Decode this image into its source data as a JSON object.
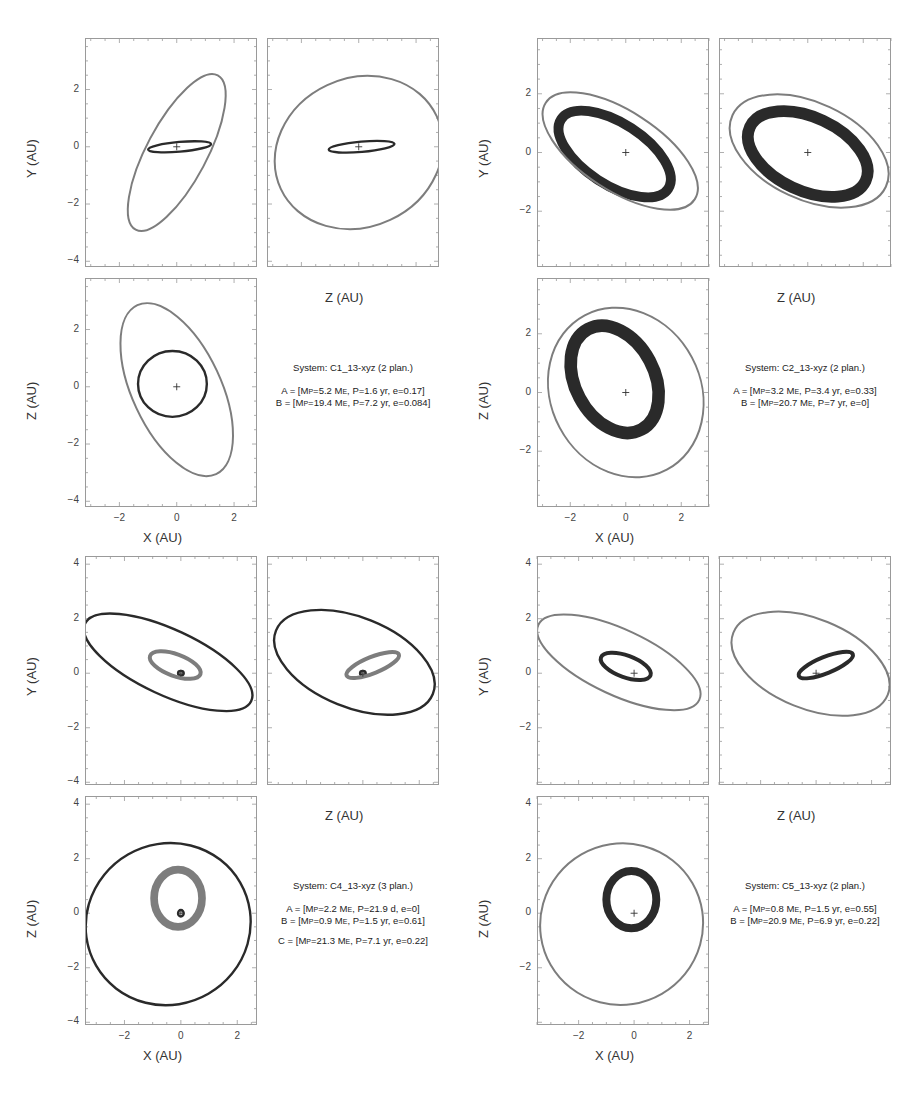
{
  "page": {
    "page_number": "9"
  },
  "axis_labels": {
    "x": "X (AU)",
    "y": "Y (AU)",
    "z": "Z (AU)"
  },
  "colors": {
    "dark_orbit": "#2a2a2a",
    "gray_orbit": "#7d7d7d",
    "frame": "#9a9a9a"
  },
  "chart_data": [
    {
      "type": "scatter",
      "title": "System: C1_13-xyz (2 plan.)",
      "panels": [
        "X-Y",
        "Z-Y",
        "X-Z"
      ],
      "xlabel": "X (AU)",
      "ylabel": "Y (AU)",
      "zlabel": "Z (AU)",
      "xlim": [
        -3.2,
        2.8
      ],
      "ylim": [
        -4.2,
        3.8
      ],
      "yticks": [
        -4,
        -2,
        0,
        2
      ],
      "xticks": [
        -2,
        0,
        2
      ],
      "grid": false,
      "planets": [
        {
          "name": "A",
          "Mp": "5.2 ME",
          "P": "1.6 yr",
          "e": "0.17",
          "color": "dark",
          "xy": {
            "cx": 0.1,
            "cy": 0.0,
            "rx": 1.1,
            "ry": 0.17,
            "rot": -5
          },
          "zy": {
            "cx": 0.1,
            "cy": 0.0,
            "rx": 1.15,
            "ry": 0.18,
            "rot": -5
          },
          "xz": {
            "cx": -0.15,
            "cy": 0.1,
            "rx": 1.2,
            "ry": 1.15,
            "rot": 0
          }
        },
        {
          "name": "B",
          "Mp": "19.4 ME",
          "P": "7.2 yr",
          "e": "0.084",
          "color": "gray",
          "xy": {
            "cx": 0.0,
            "cy": -0.2,
            "rx": 3.05,
            "ry": 1.05,
            "rot": -62
          },
          "zy": {
            "cx": 0.0,
            "cy": -0.2,
            "rx": 3.0,
            "ry": 2.6,
            "rot": -25
          },
          "xz": {
            "cx": 0.0,
            "cy": -0.1,
            "rx": 3.25,
            "ry": 1.55,
            "rot": 65
          }
        }
      ]
    },
    {
      "type": "scatter",
      "title": "System: C2_13-xyz (2 plan.)",
      "panels": [
        "X-Y",
        "Z-Y",
        "X-Z"
      ],
      "xlabel": "X (AU)",
      "ylabel": "Y (AU)",
      "zlabel": "Z (AU)",
      "xlim": [
        -3.2,
        3.0
      ],
      "ylim": [
        -3.9,
        3.9
      ],
      "yticks": [
        -2,
        0,
        2
      ],
      "xticks": [
        -2,
        0,
        2
      ],
      "grid": false,
      "planets": [
        {
          "name": "A",
          "Mp": "3.2 ME",
          "P": "3.4 yr",
          "e": "0.33",
          "color": "dark",
          "band": true,
          "xy": {
            "cx": -0.4,
            "cy": -0.05,
            "rx": 2.3,
            "ry": 1.05,
            "rot": 33
          },
          "zy": {
            "cx": 0.0,
            "cy": -0.05,
            "rx": 2.3,
            "ry": 1.25,
            "rot": 25
          },
          "xz": {
            "cx": -0.4,
            "cy": 0.45,
            "rx": 2.05,
            "ry": 1.35,
            "rot": 62
          }
        },
        {
          "name": "B",
          "Mp": "20.7 ME",
          "P": "7 yr",
          "e": "0",
          "color": "gray",
          "xy": {
            "cx": -0.2,
            "cy": 0.05,
            "rx": 3.2,
            "ry": 1.35,
            "rot": 33
          },
          "zy": {
            "cx": 0.05,
            "cy": 0.05,
            "rx": 3.05,
            "ry": 1.65,
            "rot": 25
          },
          "xz": {
            "cx": 0.0,
            "cy": 0.0,
            "rx": 3.15,
            "ry": 2.55,
            "rot": 62
          }
        }
      ]
    },
    {
      "type": "scatter",
      "title": "System: C4_13-xyz (3 plan.)",
      "panels": [
        "X-Y",
        "Z-Y",
        "X-Z"
      ],
      "xlabel": "X (AU)",
      "ylabel": "Y (AU)",
      "zlabel": "Z (AU)",
      "xlim": [
        -3.4,
        2.7
      ],
      "ylim": [
        -4.1,
        4.3
      ],
      "yticks": [
        -4,
        -2,
        0,
        2,
        4
      ],
      "xticks": [
        -2,
        0,
        2
      ],
      "grid": false,
      "planets": [
        {
          "name": "A",
          "Mp": "2.2 ME",
          "P": "21.9 d",
          "e": "0",
          "color": "dark",
          "xy": {
            "cx": 0.0,
            "cy": 0.0,
            "rx": 0.1,
            "ry": 0.08,
            "rot": 0
          },
          "zy": {
            "cx": 0.0,
            "cy": 0.0,
            "rx": 0.1,
            "ry": 0.08,
            "rot": 0
          },
          "xz": {
            "cx": 0.0,
            "cy": 0.0,
            "rx": 0.1,
            "ry": 0.12,
            "rot": 0
          }
        },
        {
          "name": "B",
          "Mp": "0.9 ME",
          "P": "1.5 yr",
          "e": "0.61",
          "color": "gray",
          "band": true,
          "xy": {
            "cx": -0.2,
            "cy": 0.3,
            "rx": 0.95,
            "ry": 0.4,
            "rot": 20
          },
          "zy": {
            "cx": 0.35,
            "cy": 0.3,
            "rx": 1.0,
            "ry": 0.3,
            "rot": -22
          },
          "xz": {
            "cx": -0.1,
            "cy": 0.55,
            "rx": 0.85,
            "ry": 1.05,
            "rot": 0
          }
        },
        {
          "name": "C",
          "Mp": "21.3 ME",
          "P": "7.1 yr",
          "e": "0.22",
          "color": "dark",
          "xy": {
            "cx": -0.45,
            "cy": 0.4,
            "rx": 3.25,
            "ry": 1.2,
            "rot": 25
          },
          "zy": {
            "cx": -0.3,
            "cy": 0.4,
            "rx": 3.0,
            "ry": 1.65,
            "rot": 22
          },
          "xz": {
            "cx": -0.45,
            "cy": -0.4,
            "rx": 2.95,
            "ry": 2.95,
            "rot": -30
          }
        }
      ]
    },
    {
      "type": "scatter",
      "title": "System: C5_13-xyz (2 plan.)",
      "panels": [
        "X-Y",
        "Z-Y",
        "X-Z"
      ],
      "xlabel": "X (AU)",
      "ylabel": "Y (AU)",
      "zlabel": "Z (AU)",
      "xlim": [
        -3.5,
        2.7
      ],
      "ylim": [
        -4.1,
        4.3
      ],
      "yticks": [
        -2,
        0,
        2,
        4
      ],
      "xticks": [
        -2,
        0,
        2
      ],
      "grid": false,
      "planets": [
        {
          "name": "A",
          "Mp": "0.8 ME",
          "P": "1.5 yr",
          "e": "0.55",
          "color": "dark",
          "band": true,
          "xy": {
            "cx": -0.3,
            "cy": 0.25,
            "rx": 0.95,
            "ry": 0.4,
            "rot": 20
          },
          "zy": {
            "cx": 0.35,
            "cy": 0.3,
            "rx": 1.05,
            "ry": 0.3,
            "rot": -22
          },
          "xz": {
            "cx": -0.1,
            "cy": 0.5,
            "rx": 0.9,
            "ry": 1.05,
            "rot": 0
          }
        },
        {
          "name": "B",
          "Mp": "20.9 ME",
          "P": "6.9 yr",
          "e": "0.22",
          "color": "gray",
          "xy": {
            "cx": -0.55,
            "cy": 0.4,
            "rx": 3.2,
            "ry": 1.2,
            "rot": 25
          },
          "zy": {
            "cx": -0.2,
            "cy": 0.35,
            "rx": 3.0,
            "ry": 1.65,
            "rot": 22
          },
          "xz": {
            "cx": -0.45,
            "cy": -0.4,
            "rx": 2.95,
            "ry": 2.95,
            "rot": -30
          }
        }
      ]
    }
  ],
  "systems": [
    {
      "title": "System: C1_13-xyz (2 plan.)",
      "lines": [
        "A = [Mp=5.2 ME, P=1.6 yr, e=0.17]",
        "B = [Mp=19.4 ME, P=7.2 yr, e=0.084]"
      ]
    },
    {
      "title": "System: C2_13-xyz (2 plan.)",
      "lines": [
        "A = [Mp=3.2 ME, P=3.4 yr, e=0.33]",
        "B = [Mp=20.7 ME, P=7 yr, e=0]"
      ]
    },
    {
      "title": "System: C4_13-xyz (3 plan.)",
      "lines": [
        "A = [Mp=2.2 ME, P=21.9 d, e=0]",
        "B = [Mp=0.9 ME, P=1.5 yr, e=0.61]",
        "C = [Mp=21.3 ME, P=7.1 yr, e=0.22]"
      ]
    },
    {
      "title": "System: C5_13-xyz (2 plan.)",
      "lines": [
        "A = [Mp=0.8 ME, P=1.5 yr, e=0.55]",
        "B = [Mp=20.9 ME, P=6.9 yr, e=0.22]"
      ]
    }
  ]
}
